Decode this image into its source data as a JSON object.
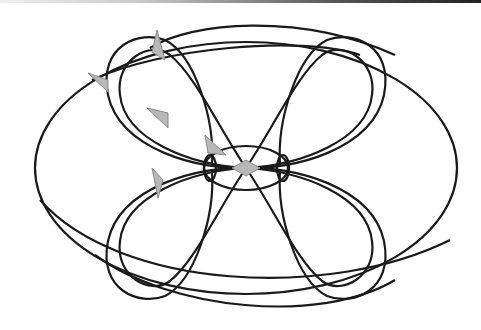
{
  "diagram": {
    "type": "curve-figure",
    "colors": {
      "stroke": "#1a1a1a",
      "marker_fill": "#b8b8b8",
      "marker_stroke": "#8a8a8a",
      "background": "#ffffff"
    },
    "center": [
      246,
      168
    ],
    "outer_ellipse": {
      "cx": 246,
      "cy": 168,
      "rx": 211,
      "ry": 126
    },
    "inner_ellipse": {
      "cx": 246,
      "cy": 168,
      "rx": 42,
      "ry": 22
    },
    "diamond": {
      "cx": 246,
      "cy": 168,
      "hw": 14,
      "hh": 8
    },
    "arrow_count": 5,
    "loop_count": 8
  }
}
